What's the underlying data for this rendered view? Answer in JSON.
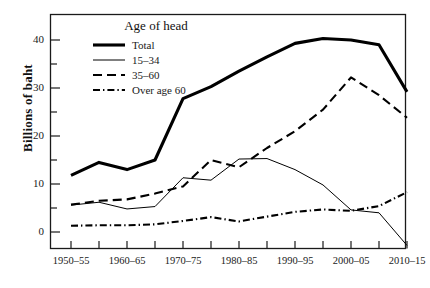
{
  "chart_data": {
    "type": "line",
    "title": "",
    "subtitle": "",
    "xlabel": "",
    "ylabel": "Billions of baht",
    "legend_title": "Age of head",
    "legend_position": "upper-left-inside",
    "grid": false,
    "xlim": [
      "1950–55",
      "2010–15"
    ],
    "ylim": [
      -5,
      43
    ],
    "yticks_major": [
      0,
      10,
      20,
      30,
      40
    ],
    "yticks_minor": [
      5,
      15,
      25,
      35
    ],
    "ytick_labels": [
      "0",
      "10",
      "20",
      "30",
      "40"
    ],
    "categories": [
      "1950–55",
      "1955–60",
      "1960–65",
      "1965–70",
      "1970–75",
      "1975–80",
      "1980–85",
      "1985–90",
      "1990–95",
      "1995–2000",
      "2000–05",
      "2005–10",
      "2010–15"
    ],
    "xtick_labels_shown": [
      "1950–55",
      "1960–65",
      "1970–75",
      "1980–85",
      "1990–95",
      "2000–05",
      "2010–15"
    ],
    "series": [
      {
        "name": "Total",
        "style": "solid-thick",
        "color": "#000000",
        "values": [
          11.8,
          14.5,
          13.0,
          15.0,
          27.8,
          30.3,
          33.5,
          36.5,
          39.3,
          40.3,
          40.0,
          39.0,
          29.2
        ]
      },
      {
        "name": "15–34",
        "style": "solid-thin",
        "color": "#000000",
        "values": [
          5.6,
          6.2,
          4.8,
          5.3,
          11.3,
          10.8,
          15.2,
          15.3,
          13.0,
          9.8,
          4.6,
          4.0,
          -2.8
        ]
      },
      {
        "name": "35–60",
        "style": "dashed",
        "color": "#000000",
        "values": [
          5.7,
          6.5,
          6.8,
          8.0,
          9.5,
          15.0,
          13.5,
          17.5,
          21.0,
          25.5,
          32.2,
          28.5,
          23.8
        ]
      },
      {
        "name": "Over age 60",
        "style": "dash-dot",
        "color": "#000000",
        "values": [
          1.3,
          1.4,
          1.4,
          1.6,
          2.3,
          3.1,
          2.2,
          3.2,
          4.2,
          4.7,
          4.4,
          5.4,
          8.3
        ]
      }
    ]
  },
  "axis": {
    "ylabel": "Billions of baht",
    "ytick_0": "0",
    "ytick_10": "10",
    "ytick_20": "20",
    "ytick_30": "30",
    "ytick_40": "40",
    "xtick_0": "1950–55",
    "xtick_1": "1960–65",
    "xtick_2": "1970–75",
    "xtick_3": "1980–85",
    "xtick_4": "1990–95",
    "xtick_5": "2000–05",
    "xtick_6": "2010–15"
  },
  "legend": {
    "title": "Age of head",
    "items": [
      {
        "label": "Total"
      },
      {
        "label": "15–34"
      },
      {
        "label": "35–60"
      },
      {
        "label": "Over age 60"
      }
    ]
  }
}
